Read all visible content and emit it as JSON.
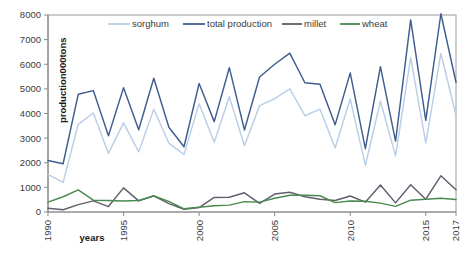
{
  "chart_data": {
    "type": "line",
    "title": "",
    "xlabel": "years",
    "ylabel": "production000tons",
    "ylim": [
      0,
      8000
    ],
    "ytick_step": 1000,
    "yticks": [
      "0",
      "1000",
      "2000",
      "3000",
      "4000",
      "5000",
      "6000",
      "7000",
      "8000"
    ],
    "xlim": [
      1990,
      2017
    ],
    "xticks": [
      "1990",
      "1995",
      "2000",
      "2005",
      "2010",
      "2015",
      "2017"
    ],
    "x": [
      1990,
      1991,
      1992,
      1993,
      1994,
      1995,
      1996,
      1997,
      1998,
      1999,
      2000,
      2001,
      2002,
      2003,
      2004,
      2005,
      2006,
      2007,
      2008,
      2009,
      2010,
      2011,
      2012,
      2013,
      2014,
      2015,
      2016,
      2017
    ],
    "grid": false,
    "legend_position": "top",
    "series": [
      {
        "name": "sorghum",
        "color": "#b9cfe7",
        "values": [
          1530,
          1200,
          3560,
          4020,
          2380,
          3620,
          2440,
          4170,
          2790,
          2340,
          4400,
          2830,
          4680,
          2690,
          4320,
          4600,
          5000,
          3910,
          4180,
          2600,
          4590,
          1900,
          4500,
          2280,
          6280,
          2800,
          6440,
          3930
        ]
      },
      {
        "name": "total production",
        "color": "#3f5d8f",
        "values": [
          2090,
          1960,
          4780,
          4930,
          3100,
          5050,
          3340,
          5430,
          3440,
          2650,
          5220,
          3670,
          5860,
          3330,
          5480,
          6000,
          6450,
          5250,
          5190,
          3540,
          5650,
          2570,
          5900,
          2880,
          7800,
          3720,
          8050,
          5270
        ]
      },
      {
        "name": "millet",
        "color": "#5f5f6d",
        "values": [
          150,
          90,
          300,
          450,
          220,
          980,
          450,
          660,
          340,
          110,
          180,
          590,
          600,
          780,
          350,
          730,
          800,
          620,
          520,
          470,
          650,
          400,
          1100,
          370,
          1110,
          520,
          1470,
          900
        ]
      },
      {
        "name": "wheat",
        "color": "#4a8a50",
        "values": [
          400,
          620,
          900,
          480,
          470,
          450,
          470,
          650,
          430,
          130,
          190,
          250,
          280,
          420,
          400,
          560,
          680,
          680,
          660,
          380,
          450,
          440,
          360,
          230,
          480,
          520,
          560,
          510
        ]
      }
    ]
  },
  "legend": {
    "items": [
      {
        "label": "sorghum"
      },
      {
        "label": "total  production"
      },
      {
        "label": "millet"
      },
      {
        "label": "wheat"
      }
    ]
  }
}
